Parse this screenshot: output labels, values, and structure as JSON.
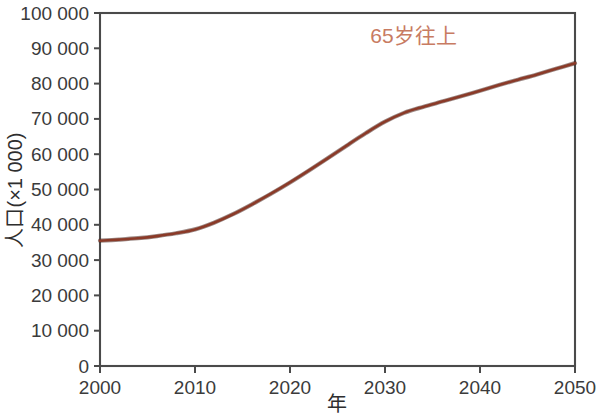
{
  "chart_data": {
    "type": "line",
    "title": "",
    "xlabel": "年",
    "ylabel": "人口(×1 000)",
    "xlim": [
      2000,
      2050
    ],
    "ylim": [
      0,
      100000
    ],
    "grid": false,
    "legend_position": "inline-annotation",
    "x_ticks": [
      "2000",
      "2010",
      "2020",
      "2030",
      "2040",
      "2050"
    ],
    "x_tick_values": [
      2000,
      2010,
      2020,
      2030,
      2040,
      2050
    ],
    "y_ticks": [
      "0",
      "10 000",
      "20 000",
      "30 000",
      "40 000",
      "50 000",
      "60 000",
      "70 000",
      "80 000",
      "90 000",
      "100 000"
    ],
    "y_tick_values": [
      0,
      10000,
      20000,
      30000,
      40000,
      50000,
      60000,
      70000,
      80000,
      90000,
      100000
    ],
    "series": [
      {
        "name": "65岁往上",
        "color": "#8B3A28",
        "annotation": "65岁往上",
        "annotation_color": "#C87B62",
        "annotation_x": 2033,
        "annotation_y": 91500,
        "x": [
          2000,
          2002,
          2004,
          2006,
          2008,
          2010,
          2012,
          2014,
          2016,
          2018,
          2020,
          2022,
          2024,
          2026,
          2028,
          2030,
          2032,
          2034,
          2036,
          2038,
          2040,
          2042,
          2044,
          2046,
          2048,
          2050
        ],
        "values": [
          35500,
          35800,
          36200,
          36800,
          37600,
          38700,
          40600,
          43000,
          45800,
          48800,
          52000,
          55400,
          58900,
          62500,
          66000,
          69200,
          71700,
          73400,
          74900,
          76400,
          78000,
          79600,
          81100,
          82600,
          84200,
          85800
        ]
      }
    ]
  },
  "figure": {
    "plot_left": 100,
    "plot_right": 575,
    "plot_top": 13,
    "plot_bottom": 366
  }
}
